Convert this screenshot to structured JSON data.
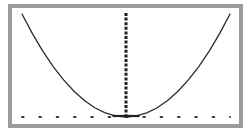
{
  "figure": {
    "title": "",
    "frame_color": "#9b9b9b",
    "background_color": "#ffffff",
    "curve_color": "#2b2b2b",
    "axis_color": "#3a3a3a",
    "alt_text": "Parabola opening upward with dotted horizontal axis and dashed vertical axis of symmetry"
  },
  "chart_data": {
    "type": "line",
    "title": "",
    "subtitle": "",
    "xlabel": "",
    "ylabel": "",
    "grid": false,
    "legend": null,
    "legend_position": "none",
    "xlim": [
      -1,
      1
    ],
    "ylim": [
      0,
      1
    ],
    "xticks": [],
    "yticks": [],
    "xticklabels": [],
    "yticklabels": [],
    "series": [
      {
        "name": "parabola",
        "style": "solid",
        "color": "#2b2b2b",
        "x": [
          -1.0,
          -0.9,
          -0.8,
          -0.7,
          -0.6,
          -0.5,
          -0.4,
          -0.3,
          -0.2,
          -0.1,
          0.0,
          0.1,
          0.2,
          0.3,
          0.4,
          0.5,
          0.6,
          0.7,
          0.8,
          0.9,
          1.0
        ],
        "values": [
          1.0,
          0.81,
          0.64,
          0.49,
          0.36,
          0.25,
          0.16,
          0.09,
          0.04,
          0.01,
          0.0,
          0.01,
          0.04,
          0.09,
          0.16,
          0.25,
          0.36,
          0.49,
          0.64,
          0.81,
          1.0
        ]
      }
    ],
    "annotations": [
      {
        "name": "axis-of-symmetry",
        "style": "dashed",
        "orientation": "vertical",
        "x": 0.0,
        "y_from": 0.0,
        "y_to": 1.0,
        "color": "#1f1f1f"
      },
      {
        "name": "horizontal-axis",
        "style": "dotted",
        "orientation": "horizontal",
        "y": 0.0,
        "x_from": -1.0,
        "x_to": 1.0,
        "color": "#3a3a3a",
        "dot_count": 13
      },
      {
        "name": "vertex-marker",
        "style": "solid-segment",
        "x": 0.0,
        "y": 0.0,
        "color": "#1f1f1f"
      }
    ]
  }
}
